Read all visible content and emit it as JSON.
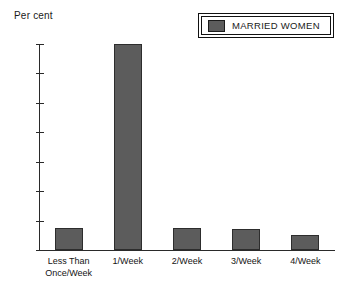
{
  "chart_data": {
    "type": "bar",
    "title": "",
    "xlabel": "",
    "ylabel": "Per cent",
    "categories": [
      "Less Than Once/Week",
      "1/Week",
      "2/Week",
      "3/Week",
      "4/Week"
    ],
    "category_lines": [
      [
        "Less Than",
        "Once/Week"
      ],
      [
        "1/Week"
      ],
      [
        "2/Week"
      ],
      [
        "3/Week"
      ],
      [
        "4/Week"
      ]
    ],
    "series": [
      {
        "name": "MARRIED WOMEN",
        "values": [
          7.5,
          70,
          7.5,
          7,
          5
        ],
        "color": "#5c5c5c"
      }
    ],
    "ylim": [
      0,
      70
    ],
    "yticks": [
      0,
      10,
      20,
      30,
      40,
      50,
      60,
      70
    ],
    "ytick_labels": [
      "0",
      "10",
      "20",
      "30",
      "40",
      "50",
      "60",
      "70"
    ],
    "grid": false,
    "legend_position": "top-right"
  },
  "legend": {
    "entries": [
      {
        "label": "MARRIED WOMEN",
        "color": "#5c5c5c"
      }
    ]
  },
  "axis": {
    "y_title": "Per cent"
  },
  "colors": {
    "bar_fill": "#5c5c5c",
    "bar_stroke": "#2d2d2d",
    "axis": "#2a2a2a",
    "text": "#141414",
    "background": "#ffffff"
  }
}
